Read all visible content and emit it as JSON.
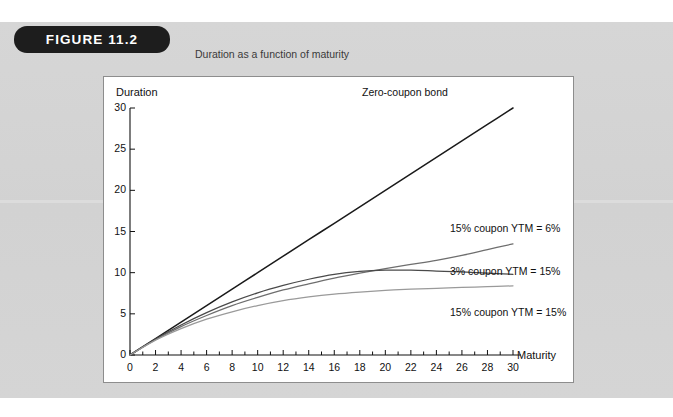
{
  "figure": {
    "badge_label": "FIGURE 11.2",
    "subtitle": "Duration as a function of maturity"
  },
  "colors": {
    "panel_background": "#d4d4d4",
    "badge_background": "#1d1d1d",
    "badge_text": "#ffffff",
    "plot_background": "#ffffff",
    "plot_border": "#8d8d8d",
    "axis": "#111111",
    "zero_coupon_curve": "#1a1a1a",
    "coupon15_ytm6_curve": "#6e6e6e",
    "coupon3_ytm15_curve": "#4a4a4a",
    "coupon15_ytm15_curve": "#9a9a9a"
  },
  "chart_data": {
    "type": "line",
    "title": "Duration as a function of maturity",
    "xlabel": "Maturity",
    "ylabel": "Duration",
    "xlim": [
      0,
      30
    ],
    "ylim": [
      0,
      30
    ],
    "grid": false,
    "legend_position": "inline-right-of-curves",
    "xticks": [
      0,
      2,
      4,
      6,
      8,
      10,
      12,
      14,
      16,
      18,
      20,
      22,
      24,
      26,
      28,
      30
    ],
    "xtick_labels": [
      "0",
      "2",
      "4",
      "6",
      "8",
      "10",
      "12",
      "14",
      "16",
      "18",
      "20",
      "22",
      "24",
      "26",
      "28",
      "30"
    ],
    "yticks": [
      0,
      5,
      10,
      15,
      20,
      25,
      30
    ],
    "ytick_labels": [
      "0",
      "5",
      "10",
      "15",
      "20",
      "25",
      "30"
    ],
    "x": [
      0,
      2,
      4,
      6,
      8,
      10,
      12,
      14,
      16,
      18,
      20,
      22,
      24,
      26,
      28,
      30
    ],
    "series": [
      {
        "name": "Zero-coupon bond",
        "color": "#1a1a1a",
        "values": [
          0,
          2,
          4,
          6,
          8,
          10,
          12,
          14,
          16,
          18,
          20,
          22,
          24,
          26,
          28,
          30
        ],
        "label_text": "Zero-coupon bond"
      },
      {
        "name": "15% coupon YTM = 6%",
        "color": "#6e6e6e",
        "values": [
          0,
          1.85,
          3.45,
          4.8,
          6.0,
          7.0,
          7.9,
          8.65,
          9.35,
          9.95,
          10.5,
          11.0,
          11.5,
          12.1,
          12.8,
          13.5
        ],
        "label_text": "15% coupon YTM = 6%"
      },
      {
        "name": "3% coupon YTM = 15%",
        "color": "#4a4a4a",
        "values": [
          0,
          1.95,
          3.65,
          5.15,
          6.45,
          7.55,
          8.45,
          9.2,
          9.8,
          10.15,
          10.3,
          10.3,
          10.2,
          10.1,
          9.95,
          9.8
        ],
        "label_text": "3% coupon YTM = 15%"
      },
      {
        "name": "15% coupon YTM = 15%",
        "color": "#9a9a9a",
        "values": [
          0,
          1.8,
          3.2,
          4.35,
          5.25,
          6.0,
          6.6,
          7.05,
          7.4,
          7.65,
          7.85,
          8.0,
          8.1,
          8.2,
          8.3,
          8.4
        ],
        "label_text": "15% coupon YTM = 15%"
      }
    ]
  }
}
